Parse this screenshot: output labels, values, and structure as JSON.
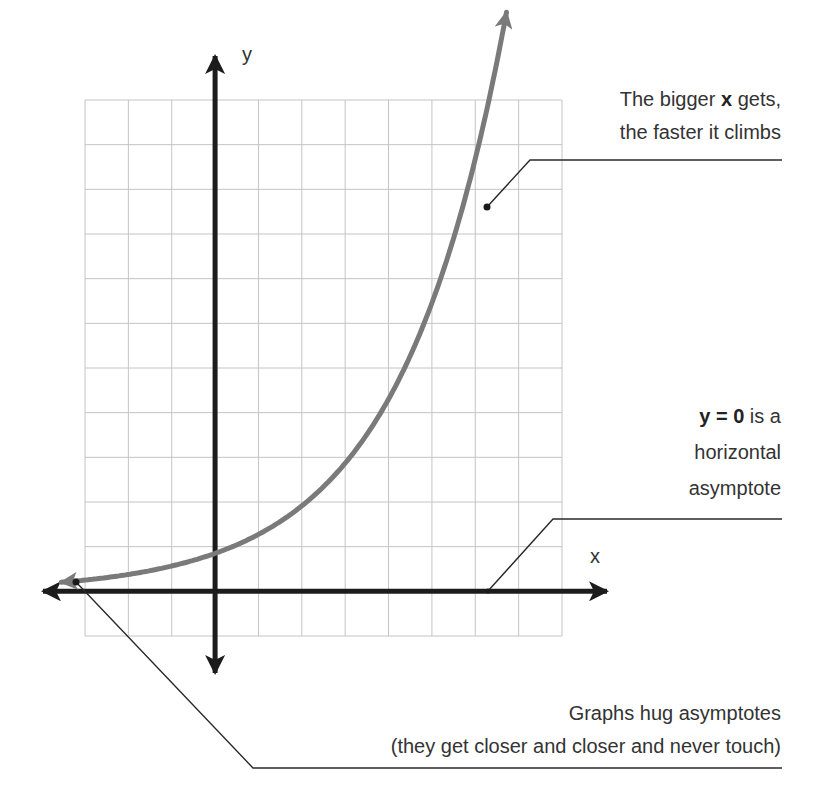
{
  "chart_data": {
    "type": "line",
    "title": "",
    "xlabel": "x",
    "ylabel": "y",
    "xlim": [
      -3,
      8
    ],
    "ylim": [
      -1,
      11
    ],
    "grid": true,
    "grid_step": 1,
    "series": [
      {
        "name": "exponential growth curve",
        "function": "y = 0.85 * 1.5^x",
        "x": [
          -3.2,
          -2,
          -1,
          0,
          1,
          2,
          3,
          4,
          5,
          6,
          6.6
        ],
        "values": [
          0.2,
          0.38,
          0.57,
          0.85,
          1.28,
          1.9,
          2.8,
          4.0,
          5.6,
          8.3,
          11.2
        ],
        "color": "#7a7a7a"
      }
    ],
    "annotations": [
      {
        "text": "The bigger x gets, the faster it climbs",
        "points_to": [
          6.2,
          8.6
        ]
      },
      {
        "text": "y = 0 is a horizontal asymptote",
        "points_to": [
          6.2,
          0
        ]
      },
      {
        "text": "Graphs hug asymptotes (they get closer and closer and never touch)",
        "points_to": [
          -3.2,
          0.2
        ]
      }
    ]
  },
  "axes": {
    "x_label": "x",
    "y_label": "y",
    "axis_color": "#1c1c1c",
    "grid_color": "#c4c4c4",
    "curve_color": "#7a7a7a"
  },
  "annotations": {
    "top": {
      "line1_pre": "The bigger ",
      "line1_bold": "x",
      "line1_post": " gets,",
      "line2": "the faster it climbs"
    },
    "middle": {
      "line1_bold": "y = 0",
      "line1_post": " is a",
      "line2": "horizontal",
      "line3": "asymptote"
    },
    "bottom": {
      "line1": "Graphs hug asymptotes",
      "line2": "(they get closer and closer and never touch)"
    }
  }
}
